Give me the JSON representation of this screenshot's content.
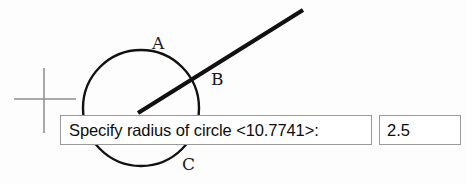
{
  "canvas": {
    "width": 467,
    "height": 185,
    "background": "#fdfdfd",
    "stroke_color": "#111111",
    "cursor_color": "#8d8d8d"
  },
  "cursor": {
    "name": "crosshair-cursor",
    "center_x": 44,
    "center_y": 99,
    "h_start_x": 14,
    "h_end_x": 76,
    "v_start_y": 68,
    "v_end_y": 133
  },
  "geometry": {
    "circle": {
      "name": "circle-preview",
      "center_x": 141,
      "center_y": 108,
      "radius": 58,
      "stroke_width": 2.4
    },
    "radius_line": {
      "name": "radius-rubber-band-line",
      "x1": 138,
      "y1": 113,
      "x2": 303,
      "y2": 10,
      "stroke_width": 4.2
    },
    "labels": [
      {
        "id": "A",
        "text": "A",
        "x": 152,
        "y": 35
      },
      {
        "id": "B",
        "text": "B",
        "x": 211,
        "y": 71
      },
      {
        "id": "C",
        "text": "C",
        "x": 182,
        "y": 156
      }
    ]
  },
  "dynamic_input": {
    "prompt_label": "Specify radius of circle <10.7741>:",
    "prompt_command": "Specify radius of circle",
    "default_value": "10.7741",
    "input_value": "2.5",
    "input_placeholder": "",
    "border_color": "#9a9a9a",
    "field_background": "#ffffff",
    "text_color": "#0d0d0d"
  }
}
